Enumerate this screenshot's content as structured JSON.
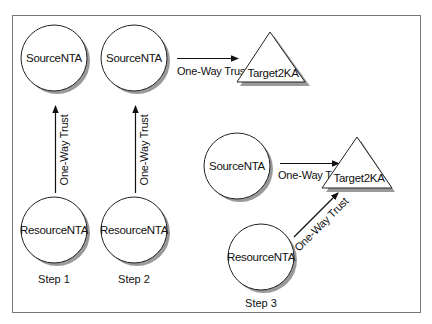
{
  "diagram": {
    "nodes": {
      "s1_source": {
        "label": "SourceNTA",
        "shape": "circle"
      },
      "s1_resource": {
        "label": "ResourceNTA",
        "shape": "circle"
      },
      "s2_source": {
        "label": "SourceNTA",
        "shape": "circle"
      },
      "s2_resource": {
        "label": "ResourceNTA",
        "shape": "circle"
      },
      "s2_target": {
        "label": "Target2KA",
        "shape": "triangle"
      },
      "s3_source": {
        "label": "SourceNTA",
        "shape": "circle"
      },
      "s3_resource": {
        "label": "ResourceNTA",
        "shape": "circle"
      },
      "s3_target": {
        "label": "Target2KA",
        "shape": "triangle"
      }
    },
    "edges": {
      "s1_resource_to_source": {
        "label": "One-Way Trust",
        "from": "ResourceNTA",
        "to": "SourceNTA"
      },
      "s2_resource_to_source": {
        "label": "One-Way Trust",
        "from": "ResourceNTA",
        "to": "SourceNTA"
      },
      "s2_source_to_target": {
        "label": "One-Way Trust",
        "from": "SourceNTA",
        "to": "Target2KA"
      },
      "s3_source_to_target": {
        "label": "One-Way Trust",
        "from": "SourceNTA",
        "to": "Target2KA"
      },
      "s3_resource_to_target": {
        "label": "One-Way Trust",
        "from": "ResourceNTA",
        "to": "Target2KA"
      }
    },
    "steps": {
      "step1": "Step 1",
      "step2": "Step 2",
      "step3": "Step 3"
    },
    "colors": {
      "stroke": "#222222",
      "shadow": "#9a9a9a",
      "fill": "#ffffff",
      "frame": "#777777"
    }
  }
}
